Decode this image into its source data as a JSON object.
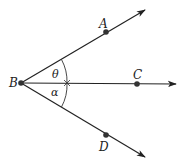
{
  "diagram": {
    "type": "geometry-angles",
    "vertex": {
      "label": "B",
      "x": 21,
      "y": 83
    },
    "rays": [
      {
        "name": "BA",
        "point": {
          "label": "A",
          "x": 106,
          "y": 32,
          "label_x": 100,
          "label_y": 27
        },
        "end": {
          "x": 145,
          "y": 9
        }
      },
      {
        "name": "BC",
        "point": {
          "label": "C",
          "x": 137,
          "y": 84,
          "label_x": 134,
          "label_y": 78
        },
        "end": {
          "x": 176,
          "y": 84
        }
      },
      {
        "name": "BD",
        "point": {
          "label": "D",
          "x": 106,
          "y": 135,
          "label_x": 100,
          "label_y": 150
        },
        "end": {
          "x": 145,
          "y": 158
        }
      }
    ],
    "angles": [
      {
        "symbol": "θ",
        "between": [
          "BA",
          "BC"
        ],
        "label_x": 52,
        "label_y": 77
      },
      {
        "symbol": "α",
        "between": [
          "BC",
          "BD"
        ],
        "label_x": 51,
        "label_y": 96
      }
    ],
    "line_color": "#222222"
  }
}
